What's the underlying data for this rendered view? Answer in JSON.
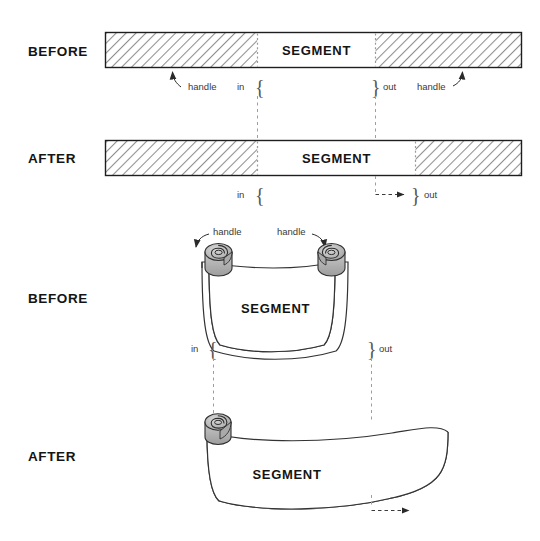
{
  "figure": {
    "title_text": "",
    "background_color": "#ffffff",
    "ink_color": "#1a1a1a",
    "hatch_color": "#8c8c8c"
  },
  "panels": {
    "flat_before": {
      "row_label": "BEFORE",
      "segment_label": "SEGMENT",
      "handle_left_label": "handle",
      "handle_right_label": "handle",
      "in_label": "in",
      "out_label": "out",
      "in_brace": "{",
      "out_brace": "}"
    },
    "flat_after": {
      "row_label": "AFTER",
      "segment_label": "SEGMENT",
      "in_label": "in",
      "out_label": "out",
      "in_brace": "{",
      "out_brace": "}"
    },
    "rolled_before": {
      "row_label": "BEFORE",
      "segment_label": "SEGMENT",
      "handle_left_label": "handle",
      "handle_right_label": "handle",
      "in_label": "in",
      "out_label": "out",
      "in_brace": "{",
      "out_brace": "}"
    },
    "rolled_after": {
      "row_label": "AFTER",
      "segment_label": "SEGMENT"
    }
  }
}
